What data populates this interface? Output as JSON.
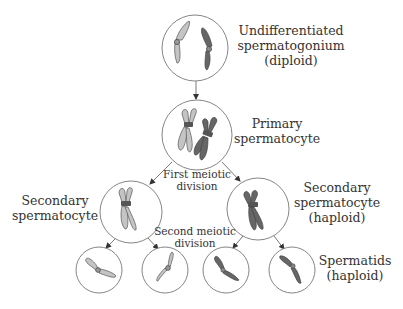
{
  "diagram": {
    "stages": [
      {
        "id": "spermatogonium",
        "label_lines": [
          "Undifferentiated",
          "spermatogonium",
          "(diploid)"
        ]
      },
      {
        "id": "primary",
        "label_lines": [
          "Primary",
          "spermatocyte"
        ]
      },
      {
        "id": "secondary_left",
        "label_lines": [
          "Secondary",
          "spermatocyte"
        ]
      },
      {
        "id": "secondary_right",
        "label_lines": [
          "Secondary",
          "spermatocyte",
          "(haploid)"
        ]
      },
      {
        "id": "spermatids",
        "label_lines": [
          "Spermatids",
          "(haploid)"
        ]
      }
    ],
    "divisions": [
      {
        "id": "first",
        "label_lines": [
          "First meiotic",
          "division"
        ]
      },
      {
        "id": "second",
        "label_lines": [
          "Second meiotic",
          "division"
        ]
      }
    ],
    "colors": {
      "light_chromosome": "#c4c4c4",
      "dark_chromosome": "#666666",
      "cell_outline": "#777777",
      "text": "#333333"
    }
  }
}
